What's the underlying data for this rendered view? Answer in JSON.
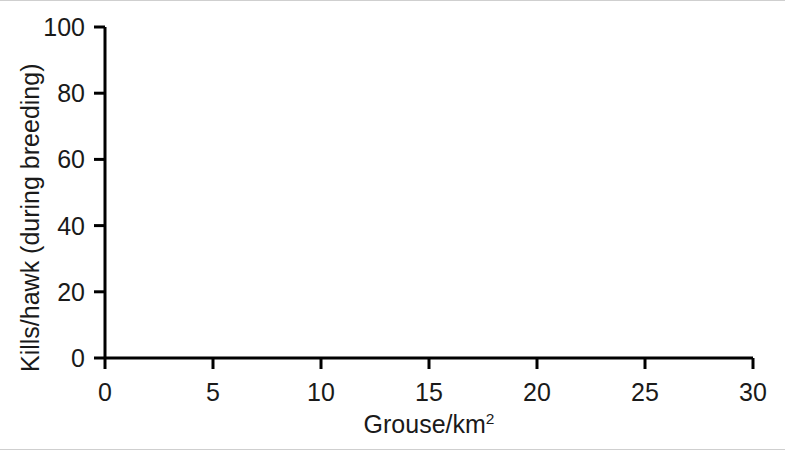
{
  "chart_data": {
    "type": "scatter",
    "title": "",
    "subtitle": "",
    "xlabel": "Grouse/km²",
    "xlabel_base": "Grouse/km",
    "xlabel_sup": "2",
    "ylabel": "Kills/hawk (during breeding)",
    "xlim": [
      0,
      30
    ],
    "ylim": [
      0,
      100
    ],
    "xticks": [
      0,
      5,
      10,
      15,
      20,
      25,
      30
    ],
    "xtick_labels": [
      "0",
      "5",
      "10",
      "15",
      "20",
      "25",
      "30"
    ],
    "yticks": [
      0,
      20,
      40,
      60,
      80,
      100
    ],
    "ytick_labels": [
      "0",
      "20",
      "40",
      "60",
      "80",
      "100"
    ],
    "grid": false,
    "legend": "none",
    "axis_style": "left-and-bottom-spines",
    "series": [
      {
        "name": "Observed kills per hawk",
        "type": "scatter",
        "marker": "filled-diamond",
        "color": "#000000",
        "points": [
          {
            "x": 4.15,
            "y": 3.4
          },
          {
            "x": 4.45,
            "y": 3.6
          },
          {
            "x": 4.75,
            "y": 4.2
          },
          {
            "x": 5.05,
            "y": 4.8
          },
          {
            "x": 5.35,
            "y": 5.4
          },
          {
            "x": 5.6,
            "y": 6.6
          },
          {
            "x": 5.8,
            "y": 7.8
          },
          {
            "x": 6.1,
            "y": 7.2
          },
          {
            "x": 6.35,
            "y": 11.2
          },
          {
            "x": 6.55,
            "y": 9.8
          },
          {
            "x": 7.05,
            "y": 11.8
          },
          {
            "x": 7.3,
            "y": 11.0
          },
          {
            "x": 7.55,
            "y": 28.0
          }
        ]
      },
      {
        "name": "Fitted type III functional response",
        "type": "line",
        "line_style": "dotted",
        "color": "#000000",
        "line_width": 6,
        "description": "Sigmoid curve rising from 0 at x=0 to about 86 at x=30, steepest near x=9-10 and levelling off past x=15",
        "points": [
          {
            "x": 0,
            "y": 0.0
          },
          {
            "x": 1,
            "y": 0.4
          },
          {
            "x": 2,
            "y": 1.1
          },
          {
            "x": 3,
            "y": 2.1
          },
          {
            "x": 4,
            "y": 3.6
          },
          {
            "x": 5,
            "y": 5.8
          },
          {
            "x": 6,
            "y": 9.2
          },
          {
            "x": 7,
            "y": 14.5
          },
          {
            "x": 8,
            "y": 22.5
          },
          {
            "x": 9,
            "y": 33.5
          },
          {
            "x": 10,
            "y": 45.5
          },
          {
            "x": 11,
            "y": 56.0
          },
          {
            "x": 12,
            "y": 64.0
          },
          {
            "x": 13,
            "y": 69.5
          },
          {
            "x": 14,
            "y": 73.0
          },
          {
            "x": 15,
            "y": 75.5
          },
          {
            "x": 16,
            "y": 77.3
          },
          {
            "x": 17,
            "y": 78.6
          },
          {
            "x": 18,
            "y": 79.7
          },
          {
            "x": 19,
            "y": 80.6
          },
          {
            "x": 20,
            "y": 81.4
          },
          {
            "x": 21,
            "y": 82.1
          },
          {
            "x": 22,
            "y": 82.7
          },
          {
            "x": 23,
            "y": 83.2
          },
          {
            "x": 24,
            "y": 83.7
          },
          {
            "x": 25,
            "y": 84.1
          },
          {
            "x": 26,
            "y": 84.5
          },
          {
            "x": 27,
            "y": 84.9
          },
          {
            "x": 28,
            "y": 85.3
          },
          {
            "x": 29,
            "y": 85.6
          },
          {
            "x": 30,
            "y": 86.0
          }
        ]
      }
    ]
  },
  "colors": {
    "ink": "#000000",
    "text": "#1a1a1a",
    "background": "#ffffff",
    "rule": "#cfcfcf"
  }
}
